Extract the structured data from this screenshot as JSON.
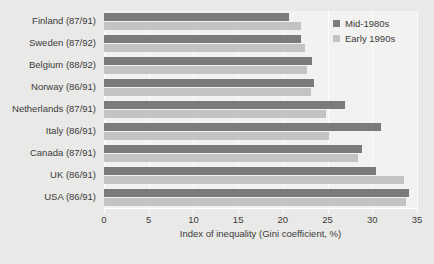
{
  "chart_data": {
    "type": "bar",
    "orientation": "horizontal",
    "title": "",
    "xlabel": "Index of inequality (Gini coefficient, %)",
    "ylabel": "",
    "xlim": [
      0,
      35
    ],
    "xticks": [
      0,
      5,
      10,
      15,
      20,
      25,
      30,
      35
    ],
    "grid": true,
    "legend_position": "top-right",
    "categories": [
      "Finland (87/91)",
      "Sweden (87/92)",
      "Belgium (88/92)",
      "Norway (86/91)",
      "Netherlands (87/91)",
      "Italy (86/91)",
      "Canada (87/91)",
      "UK (86/91)",
      "USA (86/91)"
    ],
    "series": [
      {
        "name": "Mid-1980s",
        "color": "#7b7b7b",
        "values": [
          20.7,
          22.0,
          23.3,
          23.5,
          27.0,
          31.0,
          28.9,
          30.4,
          34.1
        ]
      },
      {
        "name": "Early 1990s",
        "color": "#c3c3c1",
        "values": [
          22.0,
          22.5,
          22.7,
          23.2,
          24.8,
          25.2,
          28.4,
          33.5,
          33.8
        ]
      }
    ]
  },
  "legend": {
    "items": [
      {
        "label": "Mid-1980s",
        "color": "#7b7b7b"
      },
      {
        "label": "Early 1990s",
        "color": "#c3c3c1"
      }
    ]
  }
}
